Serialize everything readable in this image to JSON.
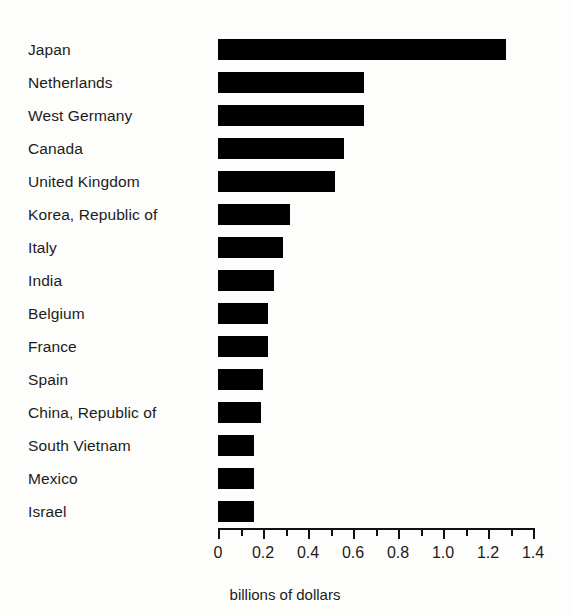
{
  "chart_data": {
    "type": "bar",
    "orientation": "horizontal",
    "title": "",
    "xlabel": "billions of dollars",
    "ylabel": "",
    "xlim": [
      0,
      1.4
    ],
    "grid": false,
    "legend": null,
    "axis": {
      "major_ticks": [
        0,
        0.2,
        0.4,
        0.6,
        0.8,
        1.0,
        1.2,
        1.4
      ],
      "minor_ticks": [
        0.1,
        0.3,
        0.5,
        0.7,
        0.9,
        1.1,
        1.3
      ],
      "tick_labels": [
        "0",
        "0.2",
        "0.4",
        "0.6",
        "0.8",
        "1.0",
        "1.2",
        "1.4"
      ]
    },
    "bar_color": "#000000",
    "background_color": "#fdfdfb",
    "categories": [
      "Japan",
      "Netherlands",
      "West Germany",
      "Canada",
      "United Kingdom",
      "Korea, Republic of",
      "Italy",
      "India",
      "Belgium",
      "France",
      "Spain",
      "China, Republic of",
      "South Vietnam",
      "Mexico",
      "Israel"
    ],
    "values": [
      1.28,
      0.65,
      0.65,
      0.56,
      0.52,
      0.32,
      0.29,
      0.25,
      0.22,
      0.22,
      0.2,
      0.19,
      0.16,
      0.16,
      0.16
    ]
  }
}
